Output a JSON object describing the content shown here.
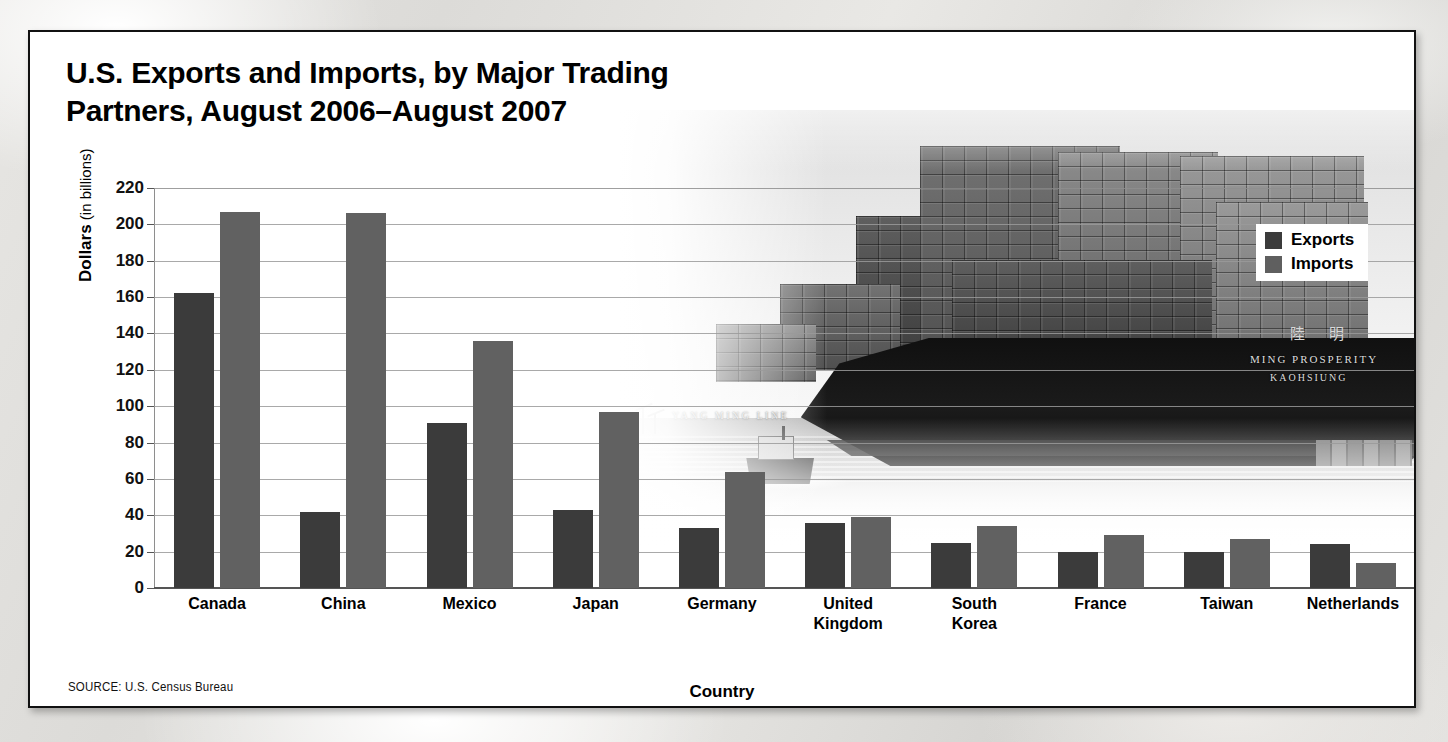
{
  "figure": {
    "source": "SOURCE: U.S. Census Bureau"
  },
  "legend": {
    "position": "top-right",
    "items": [
      {
        "label": "Exports",
        "color": "#3b3b3b"
      },
      {
        "label": "Imports",
        "color": "#5f5f5f"
      }
    ]
  },
  "photo": {
    "alt_name": "container-ship-photo",
    "ship_name": "MING PROSPERITY",
    "ship_port": "KAOHSIUNG",
    "ship_cjk": "陸 明",
    "shipping_line": "YANG MING LINE",
    "container_brand": "HANJIN"
  },
  "axes": {
    "y_label_main": "Dollars",
    "y_label_sub": " (in billions)",
    "x_title": "Country",
    "yticks": [
      220,
      200,
      180,
      160,
      140,
      120,
      100,
      80,
      60,
      40,
      20,
      0
    ]
  },
  "chart_data": {
    "type": "bar",
    "xlabel": "Country",
    "ylabel": "Dollars (in billions)",
    "ylim": [
      0,
      220
    ],
    "ytick_step": 20,
    "grid": true,
    "legend_position": "top-right",
    "categories": [
      "Canada",
      "China",
      "Mexico",
      "Japan",
      "Germany",
      "United Kingdom",
      "South Korea",
      "France",
      "Taiwan",
      "Netherlands"
    ],
    "category_lines": [
      [
        "Canada"
      ],
      [
        "China"
      ],
      [
        "Mexico"
      ],
      [
        "Japan"
      ],
      [
        "Germany"
      ],
      [
        "United",
        "Kingdom"
      ],
      [
        "South",
        "Korea"
      ],
      [
        "France"
      ],
      [
        "Taiwan"
      ],
      [
        "Netherlands"
      ]
    ],
    "series": [
      {
        "name": "Exports",
        "color": "#3b3b3b",
        "values": [
          162,
          42,
          91,
          43,
          33,
          36,
          25,
          20,
          20,
          24
        ]
      },
      {
        "name": "Imports",
        "color": "#616161",
        "values": [
          207,
          206,
          136,
          97,
          64,
          39,
          34,
          29,
          27,
          14
        ]
      }
    ],
    "units": "billions of U.S. dollars",
    "source": "U.S. Census Bureau"
  }
}
